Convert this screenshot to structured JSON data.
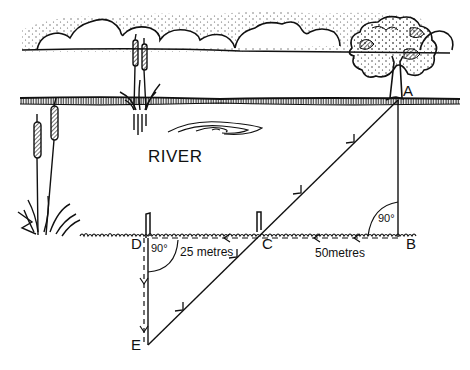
{
  "diagram": {
    "type": "geometry-illustration",
    "labels": {
      "river": "RIVER",
      "point_a": "A",
      "point_b": "B",
      "point_c": "C",
      "point_d": "D",
      "point_e": "E",
      "angle_b": "90°",
      "angle_d": "90°",
      "dist_bc": "50metres",
      "dist_cd": "25 metres"
    },
    "points": {
      "A": [
        398,
        100
      ],
      "B": [
        398,
        237
      ],
      "C": [
        260,
        237
      ],
      "D": [
        147,
        237
      ],
      "E": [
        147,
        345
      ]
    },
    "segments": [
      {
        "from": "A",
        "to": "B",
        "style": "solid"
      },
      {
        "from": "B",
        "to": "C",
        "style": "dashed",
        "arrow": "toward C"
      },
      {
        "from": "C",
        "to": "D",
        "style": "dashed",
        "arrow": "toward D"
      },
      {
        "from": "D",
        "to": "E",
        "style": "dashed",
        "arrow": "toward E"
      },
      {
        "from": "E",
        "to": "A",
        "style": "solid",
        "arrow": "toward A",
        "passes_through": "C"
      }
    ],
    "colors": {
      "ink": "#111111",
      "background": "#ffffff"
    }
  }
}
